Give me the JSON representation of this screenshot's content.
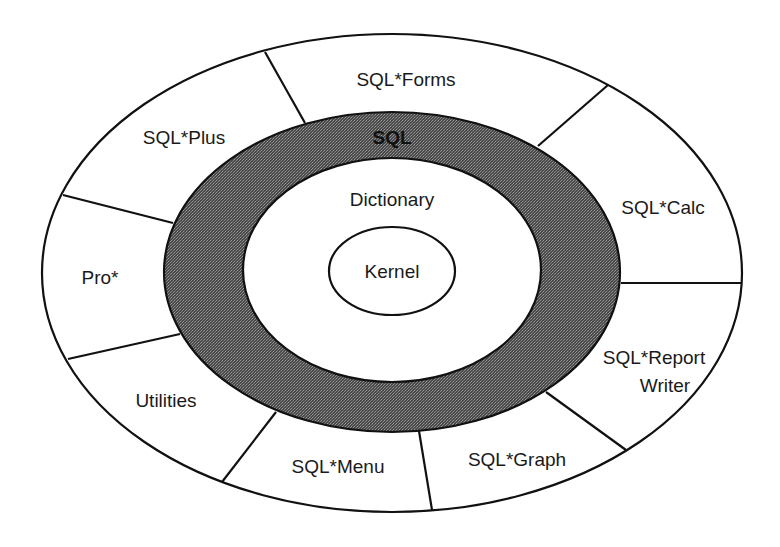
{
  "diagram": {
    "type": "concentric-layers",
    "colors": {
      "background": "#ffffff",
      "line": "#111111",
      "sql_ring_fill": "#5a5a5a",
      "text": "#1a1a1a"
    },
    "core": {
      "label": "Kernel"
    },
    "dictionary_layer": {
      "label": "Dictionary"
    },
    "sql_layer": {
      "label": "SQL"
    },
    "outer_segments": [
      {
        "id": "sql-forms",
        "label": "SQL*Forms"
      },
      {
        "id": "sql-calc",
        "label": "SQL*Calc"
      },
      {
        "id": "sql-report-writer",
        "label_line1": "SQL*Report",
        "label_line2": "Writer"
      },
      {
        "id": "sql-graph",
        "label": "SQL*Graph"
      },
      {
        "id": "sql-menu",
        "label": "SQL*Menu"
      },
      {
        "id": "utilities",
        "label": "Utilities"
      },
      {
        "id": "pro",
        "label": "Pro*"
      },
      {
        "id": "sql-plus",
        "label": "SQL*Plus"
      }
    ]
  }
}
